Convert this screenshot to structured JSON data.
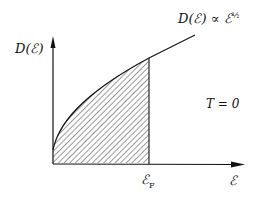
{
  "diagram": {
    "y_axis_label": "D(ℰ)",
    "x_axis_label": "ℰ",
    "curve_label": "D(ℰ) ∝ ℰ",
    "curve_label_exponent": "½",
    "fermi_label": "ℰ",
    "fermi_subscript": "F",
    "temperature_label": "T = 0",
    "shaded_region": "occupied states from 0 to ℰF (hatched)",
    "colors": {
      "line": "#111111",
      "background": "#ffffff"
    }
  }
}
